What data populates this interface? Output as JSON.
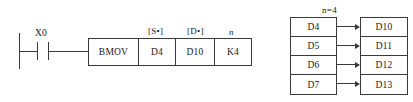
{
  "diagram": {
    "type": "plc-ladder-bmov"
  },
  "ladder": {
    "contact": {
      "label": "X0",
      "kind": "normally-open-contact"
    },
    "instruction": {
      "operation": "BMOV",
      "cells": [
        {
          "name": "operation",
          "value": "BMOV",
          "tag": ""
        },
        {
          "name": "source",
          "value": "D4",
          "tag": "[S•]"
        },
        {
          "name": "destination",
          "value": "D10",
          "tag": "[D•]"
        },
        {
          "name": "count",
          "value": "K4",
          "tag": "n"
        }
      ]
    }
  },
  "transfer": {
    "count_label": "n=4",
    "count_var": "n",
    "count_value": "4",
    "source_header": "source-registers",
    "dest_header": "destination-registers",
    "source": [
      "D4",
      "D5",
      "D6",
      "D7"
    ],
    "dest": [
      "D10",
      "D11",
      "D12",
      "D13"
    ],
    "arrows": 4
  },
  "colors": {
    "line": "#3a3a3a",
    "text": "#1a1a1a",
    "background": "#ffffff"
  }
}
